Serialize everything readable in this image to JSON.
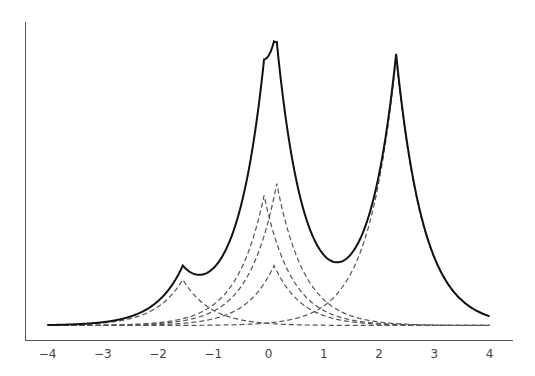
{
  "chart_data": {
    "type": "line",
    "title": "",
    "xlabel": "",
    "ylabel": "",
    "xlim": [
      -4,
      4
    ],
    "x_ticks": [
      "−4",
      "−3",
      "−2",
      "−1",
      "0",
      "1",
      "2",
      "3",
      "4"
    ],
    "x_tick_values": [
      -4,
      -3,
      -2,
      -1,
      0,
      1,
      2,
      3,
      4
    ],
    "y_ticks": [],
    "grid": false,
    "legend": null,
    "components": [
      {
        "name": "component-1",
        "center": -1.55,
        "height": 46,
        "scale": 0.5
      },
      {
        "name": "component-2",
        "center": -0.08,
        "height": 130,
        "scale": 0.5
      },
      {
        "name": "component-3",
        "center": 0.15,
        "height": 142,
        "scale": 0.5
      },
      {
        "name": "component-4",
        "center": 0.1,
        "height": 60,
        "scale": 0.5
      },
      {
        "name": "component-5",
        "center": 2.31,
        "height": 268,
        "scale": 0.5
      }
    ],
    "series": [
      {
        "name": "total",
        "style": "solid",
        "color": "#111111",
        "peaks": [
          {
            "x": -1.55,
            "y": 60
          },
          {
            "x": 0.12,
            "y": 288
          },
          {
            "x": 2.31,
            "y": 266
          }
        ],
        "valleys": [
          {
            "x": -1.3,
            "y": 55
          },
          {
            "x": 1.24,
            "y": 62
          }
        ]
      },
      {
        "name": "components",
        "style": "dashed",
        "color": "#555555"
      }
    ],
    "y_units": "pixels above baseline (relative intensity, no scale shown)"
  },
  "colors": {
    "total": "#111111",
    "component": "#555555",
    "axis": "#555555",
    "background": "#ffffff"
  }
}
